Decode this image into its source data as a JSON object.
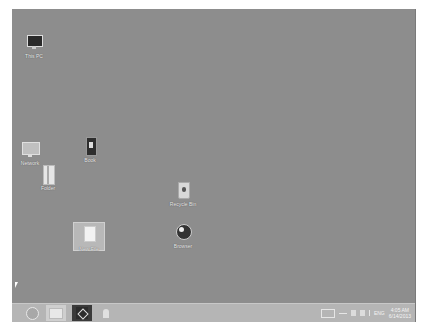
{
  "desktop": {
    "background_color": "#8d8d8d",
    "icons": [
      {
        "label": "This PC",
        "type": "computer"
      },
      {
        "label": "Network",
        "type": "network"
      },
      {
        "label": "Book",
        "type": "document"
      },
      {
        "label": "Folder",
        "type": "folder"
      },
      {
        "label": "Recycle Bin",
        "type": "recycle-bin"
      },
      {
        "label": "Browser",
        "type": "globe"
      },
      {
        "label": "New File",
        "type": "file",
        "selected": true
      }
    ]
  },
  "taskbar": {
    "items": [
      {
        "name": "start",
        "icon": "start-orb-icon"
      },
      {
        "name": "file-explorer",
        "icon": "folder-icon"
      },
      {
        "name": "acrobat",
        "icon": "pdf-icon"
      },
      {
        "name": "pinned-app",
        "icon": "pin-icon"
      }
    ],
    "tray": {
      "language": "ENG",
      "time": "4:05 AM",
      "date": "6/14/2013"
    }
  }
}
